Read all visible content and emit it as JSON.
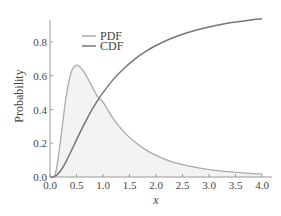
{
  "chart_data": {
    "type": "line",
    "title": "",
    "xlabel": "x",
    "ylabel": "Probability",
    "xlim": [
      0.0,
      4.0
    ],
    "ylim": [
      0.0,
      0.93
    ],
    "x_ticks": [
      "0.0",
      "0.5",
      "1.0",
      "1.5",
      "2.0",
      "2.5",
      "3.0",
      "3.5",
      "4.0"
    ],
    "y_ticks": [
      "0.0",
      "0.2",
      "0.4",
      "0.6",
      "0.8"
    ],
    "grid": false,
    "legend_position": "upper-left-inside",
    "x": [
      0.0,
      0.1,
      0.2,
      0.3,
      0.4,
      0.5,
      0.6,
      0.7,
      0.8,
      0.9,
      1.0,
      1.2,
      1.4,
      1.6,
      1.8,
      2.0,
      2.25,
      2.5,
      2.75,
      3.0,
      3.25,
      3.5,
      3.75,
      4.0
    ],
    "series": [
      {
        "name": "PDF",
        "color": "#aaaaaa",
        "filled": true,
        "fill_color": "#f3f3f3",
        "values": [
          0.0,
          0.017,
          0.219,
          0.468,
          0.621,
          0.663,
          0.641,
          0.591,
          0.533,
          0.475,
          0.443,
          0.343,
          0.266,
          0.207,
          0.162,
          0.128,
          0.096,
          0.073,
          0.057,
          0.044,
          0.035,
          0.028,
          0.022,
          0.018
        ]
      },
      {
        "name": "CDF",
        "color": "#777777",
        "filled": false,
        "values": [
          0.0,
          0.005,
          0.037,
          0.09,
          0.154,
          0.22,
          0.285,
          0.346,
          0.403,
          0.454,
          0.5,
          0.58,
          0.644,
          0.699,
          0.743,
          0.779,
          0.816,
          0.846,
          0.87,
          0.889,
          0.905,
          0.918,
          0.929,
          0.938
        ]
      }
    ],
    "legend": [
      {
        "label": "PDF",
        "color": "#aaaaaa"
      },
      {
        "label": "CDF",
        "color": "#777777"
      }
    ]
  }
}
